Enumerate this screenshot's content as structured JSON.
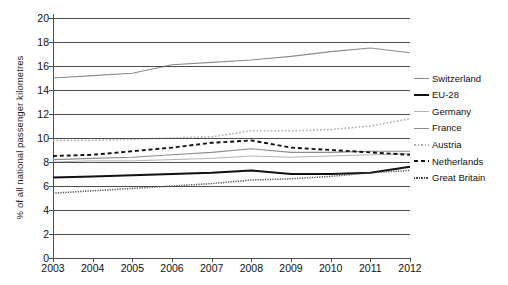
{
  "chart_data": {
    "type": "line",
    "title": "",
    "xlabel": "",
    "ylabel": "% of all national passenger kilometres",
    "categories": [
      "2003",
      "2004",
      "2005",
      "2006",
      "2007",
      "2008",
      "2009",
      "2010",
      "2011",
      "2012"
    ],
    "x": [
      2003,
      2004,
      2005,
      2006,
      2007,
      2008,
      2009,
      2010,
      2011,
      2012
    ],
    "xlim": [
      2003,
      2012
    ],
    "ylim": [
      0,
      20
    ],
    "yticks": [
      0,
      2,
      4,
      6,
      8,
      10,
      12,
      14,
      16,
      18,
      20
    ],
    "ytick_step": 2,
    "grid": "horizontal",
    "legend_position": "right",
    "series": [
      {
        "name": "Switzerland",
        "values": [
          15.0,
          15.2,
          15.4,
          16.1,
          16.3,
          16.5,
          16.8,
          17.2,
          17.5,
          17.1
        ],
        "style": "solid",
        "color": "#8c8c8c",
        "width": 1.1
      },
      {
        "name": "EU-28",
        "values": [
          6.7,
          6.8,
          6.9,
          7.0,
          7.1,
          7.3,
          7.0,
          7.0,
          7.1,
          7.6
        ],
        "style": "solid",
        "color": "#111111",
        "width": 2.0
      },
      {
        "name": "Germany",
        "values": [
          8.0,
          8.1,
          8.1,
          8.2,
          8.3,
          8.5,
          8.4,
          8.5,
          8.6,
          8.7
        ],
        "style": "solid",
        "color": "#b3b3b3",
        "width": 1.0
      },
      {
        "name": "France",
        "values": [
          8.2,
          8.3,
          8.4,
          8.6,
          8.8,
          9.1,
          8.8,
          8.8,
          8.9,
          8.9
        ],
        "style": "solid",
        "color": "#8c8c8c",
        "width": 1.1
      },
      {
        "name": "Austria",
        "values": [
          9.8,
          9.8,
          9.9,
          10.0,
          10.1,
          10.6,
          10.6,
          10.7,
          11.0,
          11.6
        ],
        "style": "dotted",
        "color": "#b0b0b0",
        "width": 1.6
      },
      {
        "name": "Netherlands",
        "values": [
          8.5,
          8.6,
          8.9,
          9.2,
          9.6,
          9.8,
          9.2,
          9.0,
          8.8,
          8.6
        ],
        "style": "dashed",
        "color": "#111111",
        "width": 1.9
      },
      {
        "name": "Great Britain",
        "values": [
          5.4,
          5.6,
          5.8,
          6.0,
          6.2,
          6.5,
          6.6,
          6.8,
          7.1,
          7.3
        ],
        "style": "fine-dotted",
        "color": "#4d4d4d",
        "width": 1.5
      }
    ]
  },
  "legend": {
    "items": [
      {
        "label": "Switzerland"
      },
      {
        "label": "EU-28"
      },
      {
        "label": "Germany"
      },
      {
        "label": "France"
      },
      {
        "label": "Austria"
      },
      {
        "label": "Netherlands"
      },
      {
        "label": "Great Britain"
      }
    ]
  }
}
